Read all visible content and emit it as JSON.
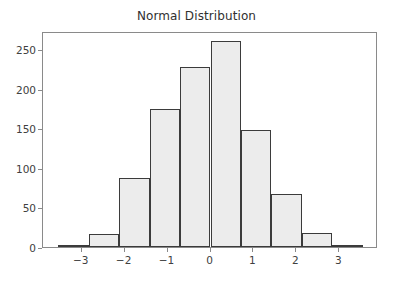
{
  "chart_data": {
    "type": "bar",
    "title": "Normal Distribution",
    "xlabel": "",
    "ylabel": "",
    "bin_edges": [
      -3.55,
      -2.84,
      -2.13,
      -1.42,
      -0.71,
      0.0,
      0.71,
      1.42,
      2.13,
      2.84,
      3.55
    ],
    "categories": [
      "-3.55 to -2.84",
      "-2.84 to -2.13",
      "-2.13 to -1.42",
      "-1.42 to -0.71",
      "-0.71 to 0.00",
      "0.00 to 0.71",
      "0.71 to 1.42",
      "1.42 to 2.13",
      "2.13 to 2.84",
      "2.84 to 3.55"
    ],
    "values": [
      3,
      17,
      87,
      175,
      227,
      260,
      148,
      67,
      18,
      3
    ],
    "xlim": [
      -3.9,
      3.9
    ],
    "ylim": [
      0,
      273
    ],
    "xticks": [
      -3,
      -2,
      -1,
      0,
      1,
      2,
      3
    ],
    "xtick_labels": [
      "−3",
      "−2",
      "−1",
      "0",
      "1",
      "2",
      "3"
    ],
    "yticks": [
      0,
      50,
      100,
      150,
      200,
      250
    ],
    "ytick_labels": [
      "0",
      "50",
      "100",
      "150",
      "200",
      "250"
    ],
    "grid": false,
    "legend": null,
    "bar_fill_color": "#ececec",
    "bar_edge_color": "#3b3b3b",
    "axes_color": "#8a8a8a",
    "background_color": "#ffffff",
    "text_color": "#404040"
  }
}
